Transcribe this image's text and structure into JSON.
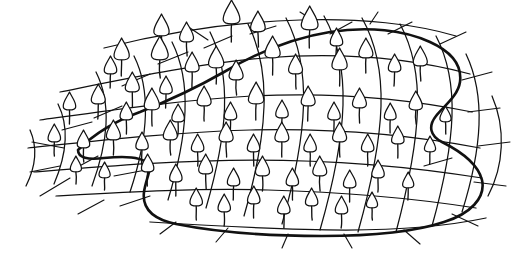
{
  "figure": {
    "technique": "pen-and-ink line drawing",
    "background_color": "#ffffff",
    "ink_color": "#111111",
    "caption": "",
    "canvas": {
      "width": 518,
      "height": 259
    }
  },
  "chart_data": {
    "type": "line",
    "xlabel": "",
    "ylabel": "",
    "xlim": [
      0,
      518
    ],
    "ylim": [
      0,
      259
    ],
    "grid": false,
    "legend": "none",
    "annotations": [
      "irregular blob-shaped net outline",
      "7 horizontal mesh cords spanning the sheet",
      "14 curved vertical mesh cords",
      "flame / bud shaped motif at many mesh crossings",
      "short whisker lines overshoot the outline on all sides"
    ],
    "outline_path": "M 78 150 C 96 132 118 120 140 112 C 168 101 196 88 224 72 C 258 52 292 38 330 32 C 368 26 404 30 430 42 C 452 52 462 66 460 82 C 458 96 444 106 436 116 C 428 126 430 136 442 142 C 462 152 478 164 482 180 C 486 198 470 214 444 222 C 414 232 370 236 322 236 C 268 236 216 232 176 224 C 152 219 142 208 144 192 C 146 178 152 170 148 164 C 142 156 124 156 104 158 C 88 160 78 158 78 150 Z",
    "horizontal_cords": [
      {
        "id": "h1",
        "d": "M 104 48 C 160 34 230 22 300 20 C 360 18 416 24 456 36"
      },
      {
        "id": "h2",
        "d": "M 60 92 C 130 78 196 64 264 58 C 340 52 410 58 470 74"
      },
      {
        "id": "h3",
        "d": "M 40 120 C 112 110 180 100 252 96 C 332 92 404 98 472 112"
      },
      {
        "id": "h4",
        "d": "M 28 148 C 104 140 176 132 250 130 C 332 128 406 134 480 148"
      },
      {
        "id": "h5",
        "d": "M 34 172 C 108 166 180 160 254 160 C 334 160 408 166 482 178"
      },
      {
        "id": "h6",
        "d": "M 56 196 C 128 192 196 188 268 190 C 344 192 412 198 476 208"
      },
      {
        "id": "h7",
        "d": "M 150 222 C 214 226 282 230 346 230 C 404 230 448 226 486 218"
      }
    ],
    "vertical_cords": [
      {
        "id": "v1",
        "d": "M 58 104 C 70 128 66 156 54 184"
      },
      {
        "id": "v2",
        "d": "M 96 72 C 112 104 108 142 92 186"
      },
      {
        "id": "v3",
        "d": "M 134 56 C 152 92 148 138 130 192"
      },
      {
        "id": "v4",
        "d": "M 172 42 C 192 82 188 134 168 200"
      },
      {
        "id": "v5",
        "d": "M 210 32 C 232 76 228 132 206 208"
      },
      {
        "id": "v6",
        "d": "M 248 24 C 272 72 268 132 244 216"
      },
      {
        "id": "v7",
        "d": "M 286 18 C 312 68 308 132 282 224"
      },
      {
        "id": "v8",
        "d": "M 324 16 C 352 66 348 132 320 230"
      },
      {
        "id": "v9",
        "d": "M 362 18 C 390 68 386 132 358 232"
      },
      {
        "id": "v10",
        "d": "M 400 24 C 426 72 422 134 396 232"
      },
      {
        "id": "v11",
        "d": "M 436 36 C 460 82 456 140 432 226"
      },
      {
        "id": "v12",
        "d": "M 466 54 C 486 96 482 148 462 212"
      },
      {
        "id": "v13",
        "d": "M 30 130 C 38 148 36 166 26 186"
      },
      {
        "id": "v14",
        "d": "M 492 96 C 506 128 504 166 488 196"
      }
    ],
    "whiskers": [
      {
        "d": "M 64 148 L 32 142"
      },
      {
        "d": "M 70 178 L 40 196"
      },
      {
        "d": "M 98 156 L 72 170"
      },
      {
        "d": "M 122 106 L 94 118"
      },
      {
        "d": "M 150 74 L 122 86"
      },
      {
        "d": "M 188 52 L 158 64"
      },
      {
        "d": "M 232 36 L 204 48"
      },
      {
        "d": "M 276 26 L 250 34"
      },
      {
        "d": "M 330 34 L 352 22"
      },
      {
        "d": "M 388 34 L 412 22"
      },
      {
        "d": "M 440 44 L 466 32"
      },
      {
        "d": "M 462 80 L 492 72"
      },
      {
        "d": "M 468 112 L 500 108"
      },
      {
        "d": "M 478 146 L 510 142"
      },
      {
        "d": "M 474 182 L 506 186"
      },
      {
        "d": "M 452 214 L 478 226"
      },
      {
        "d": "M 404 230 L 420 244"
      },
      {
        "d": "M 344 234 L 352 248"
      },
      {
        "d": "M 288 234 L 282 248"
      },
      {
        "d": "M 228 228 L 216 242"
      },
      {
        "d": "M 176 222 L 160 234"
      },
      {
        "d": "M 150 196 L 120 206"
      },
      {
        "d": "M 146 170 L 114 176"
      },
      {
        "d": "M 92 122 L 62 130"
      },
      {
        "d": "M 208 40 L 190 28"
      },
      {
        "d": "M 316 22 L 300 12"
      },
      {
        "d": "M 370 24 L 378 12"
      },
      {
        "d": "M 424 166 L 452 158"
      },
      {
        "d": "M 60 166 L 30 172"
      },
      {
        "d": "M 104 200 L 78 214"
      }
    ],
    "buds": [
      {
        "x": 162,
        "y": 36,
        "h": 22,
        "stem": 16
      },
      {
        "x": 186,
        "y": 42,
        "h": 20,
        "stem": 14
      },
      {
        "x": 232,
        "y": 24,
        "h": 24,
        "stem": 18
      },
      {
        "x": 258,
        "y": 32,
        "h": 21,
        "stem": 15
      },
      {
        "x": 310,
        "y": 30,
        "h": 24,
        "stem": 18
      },
      {
        "x": 336,
        "y": 46,
        "h": 18,
        "stem": 13
      },
      {
        "x": 122,
        "y": 60,
        "h": 22,
        "stem": 16
      },
      {
        "x": 110,
        "y": 74,
        "h": 18,
        "stem": 14
      },
      {
        "x": 132,
        "y": 92,
        "h": 20,
        "stem": 15
      },
      {
        "x": 160,
        "y": 60,
        "h": 24,
        "stem": 18
      },
      {
        "x": 166,
        "y": 94,
        "h": 18,
        "stem": 14
      },
      {
        "x": 192,
        "y": 72,
        "h": 20,
        "stem": 16
      },
      {
        "x": 216,
        "y": 68,
        "h": 22,
        "stem": 16
      },
      {
        "x": 236,
        "y": 80,
        "h": 20,
        "stem": 15
      },
      {
        "x": 272,
        "y": 58,
        "h": 22,
        "stem": 17
      },
      {
        "x": 296,
        "y": 74,
        "h": 20,
        "stem": 15
      },
      {
        "x": 340,
        "y": 70,
        "h": 22,
        "stem": 16
      },
      {
        "x": 366,
        "y": 58,
        "h": 20,
        "stem": 15
      },
      {
        "x": 394,
        "y": 72,
        "h": 18,
        "stem": 14
      },
      {
        "x": 420,
        "y": 66,
        "h": 20,
        "stem": 15
      },
      {
        "x": 70,
        "y": 110,
        "h": 18,
        "stem": 14
      },
      {
        "x": 98,
        "y": 104,
        "h": 20,
        "stem": 15
      },
      {
        "x": 126,
        "y": 120,
        "h": 18,
        "stem": 14
      },
      {
        "x": 152,
        "y": 110,
        "h": 22,
        "stem": 16
      },
      {
        "x": 178,
        "y": 122,
        "h": 18,
        "stem": 14
      },
      {
        "x": 204,
        "y": 106,
        "h": 20,
        "stem": 15
      },
      {
        "x": 230,
        "y": 120,
        "h": 18,
        "stem": 14
      },
      {
        "x": 256,
        "y": 104,
        "h": 22,
        "stem": 16
      },
      {
        "x": 282,
        "y": 118,
        "h": 18,
        "stem": 14
      },
      {
        "x": 308,
        "y": 106,
        "h": 20,
        "stem": 15
      },
      {
        "x": 334,
        "y": 120,
        "h": 18,
        "stem": 14
      },
      {
        "x": 360,
        "y": 108,
        "h": 20,
        "stem": 15
      },
      {
        "x": 390,
        "y": 120,
        "h": 17,
        "stem": 13
      },
      {
        "x": 416,
        "y": 110,
        "h": 19,
        "stem": 14
      },
      {
        "x": 446,
        "y": 122,
        "h": 16,
        "stem": 12
      },
      {
        "x": 54,
        "y": 142,
        "h": 18,
        "stem": 14
      },
      {
        "x": 84,
        "y": 148,
        "h": 18,
        "stem": 14
      },
      {
        "x": 114,
        "y": 140,
        "h": 20,
        "stem": 15
      },
      {
        "x": 142,
        "y": 150,
        "h": 18,
        "stem": 14
      },
      {
        "x": 170,
        "y": 140,
        "h": 20,
        "stem": 15
      },
      {
        "x": 198,
        "y": 152,
        "h": 18,
        "stem": 14
      },
      {
        "x": 226,
        "y": 142,
        "h": 20,
        "stem": 15
      },
      {
        "x": 254,
        "y": 152,
        "h": 18,
        "stem": 14
      },
      {
        "x": 282,
        "y": 142,
        "h": 20,
        "stem": 15
      },
      {
        "x": 310,
        "y": 152,
        "h": 18,
        "stem": 14
      },
      {
        "x": 340,
        "y": 142,
        "h": 20,
        "stem": 15
      },
      {
        "x": 368,
        "y": 152,
        "h": 18,
        "stem": 14
      },
      {
        "x": 398,
        "y": 144,
        "h": 18,
        "stem": 14
      },
      {
        "x": 430,
        "y": 152,
        "h": 16,
        "stem": 12
      },
      {
        "x": 76,
        "y": 172,
        "h": 16,
        "stem": 12
      },
      {
        "x": 104,
        "y": 178,
        "h": 16,
        "stem": 12
      },
      {
        "x": 148,
        "y": 172,
        "h": 18,
        "stem": 14
      },
      {
        "x": 176,
        "y": 182,
        "h": 18,
        "stem": 14
      },
      {
        "x": 206,
        "y": 174,
        "h": 20,
        "stem": 15
      },
      {
        "x": 234,
        "y": 186,
        "h": 18,
        "stem": 14
      },
      {
        "x": 262,
        "y": 176,
        "h": 20,
        "stem": 15
      },
      {
        "x": 292,
        "y": 186,
        "h": 18,
        "stem": 14
      },
      {
        "x": 320,
        "y": 176,
        "h": 20,
        "stem": 15
      },
      {
        "x": 350,
        "y": 188,
        "h": 18,
        "stem": 14
      },
      {
        "x": 378,
        "y": 178,
        "h": 18,
        "stem": 14
      },
      {
        "x": 408,
        "y": 188,
        "h": 16,
        "stem": 12
      },
      {
        "x": 196,
        "y": 206,
        "h": 18,
        "stem": 14
      },
      {
        "x": 224,
        "y": 212,
        "h": 18,
        "stem": 14
      },
      {
        "x": 254,
        "y": 204,
        "h": 18,
        "stem": 14
      },
      {
        "x": 284,
        "y": 214,
        "h": 18,
        "stem": 14
      },
      {
        "x": 312,
        "y": 206,
        "h": 18,
        "stem": 14
      },
      {
        "x": 342,
        "y": 214,
        "h": 18,
        "stem": 14
      },
      {
        "x": 372,
        "y": 208,
        "h": 16,
        "stem": 12
      }
    ]
  }
}
